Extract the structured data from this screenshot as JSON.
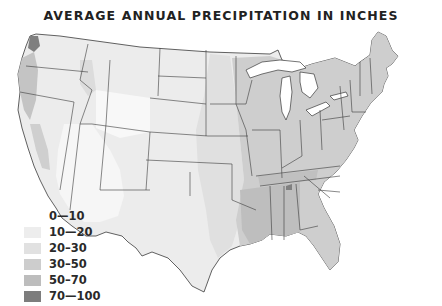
{
  "title": "AVERAGE ANNUAL PRECIPITATION IN INCHES",
  "legend": {
    "items": [
      {
        "label": "0—10",
        "color": "#ffffff"
      },
      {
        "label": "10—20",
        "color": "#ededed"
      },
      {
        "label": "20–30",
        "color": "#e1e1e1"
      },
      {
        "label": "30–50",
        "color": "#cdcdcd"
      },
      {
        "label": "50–70",
        "color": "#bdbdbd"
      },
      {
        "label": "70—100",
        "color": "#7d7d7d"
      }
    ]
  },
  "map": {
    "region": "Contiguous United States",
    "colors": {
      "border": "#3a3a3a",
      "water": "#ffffff"
    }
  }
}
